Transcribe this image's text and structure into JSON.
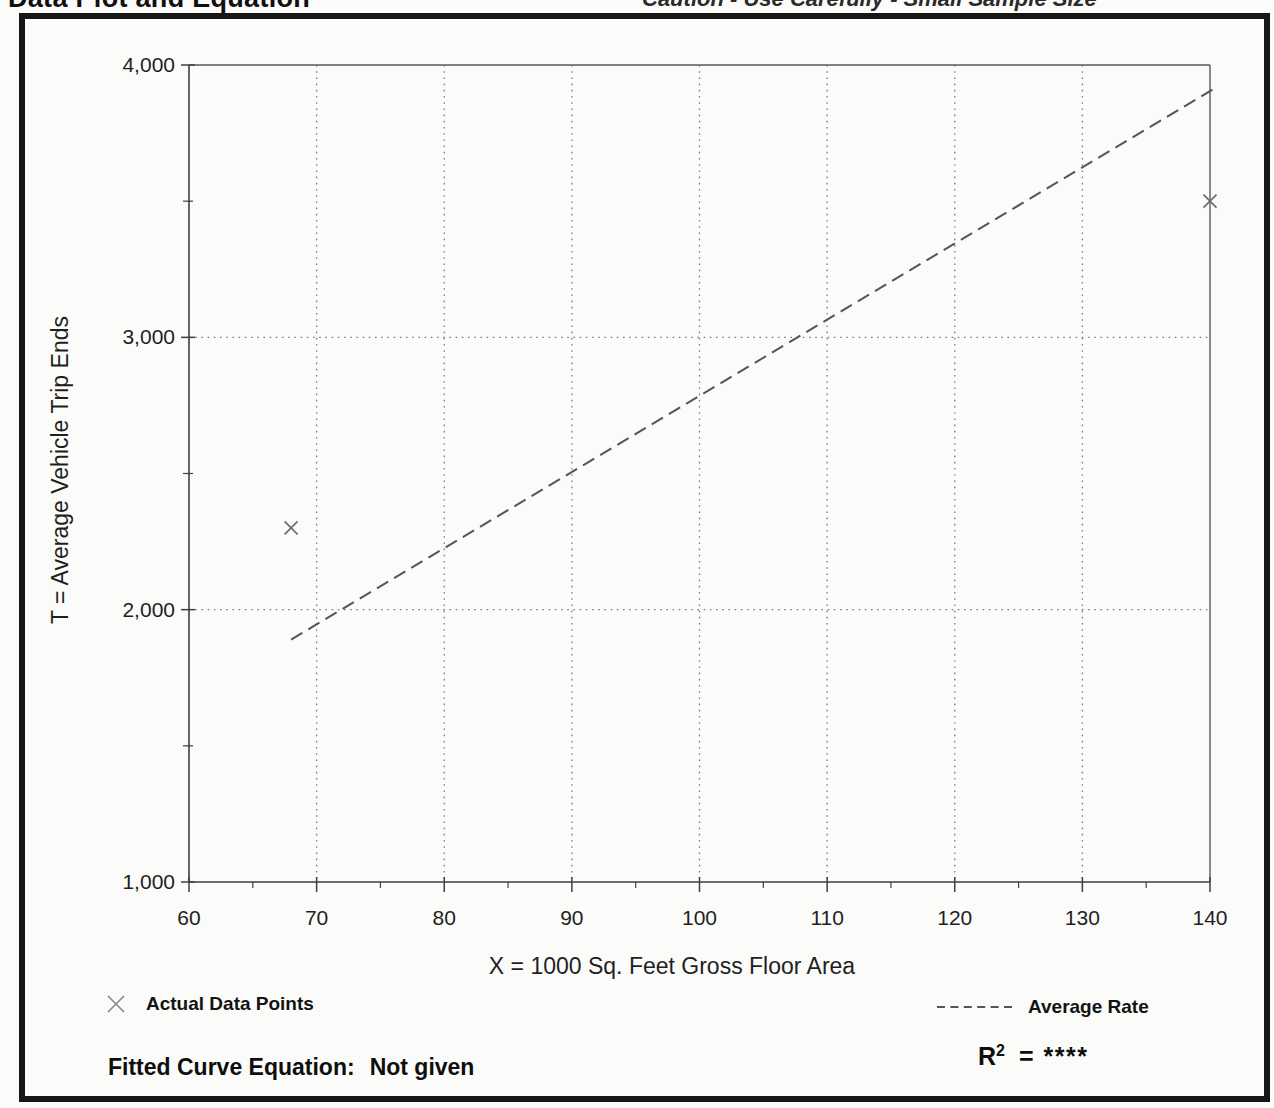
{
  "page": {
    "title": "Data Plot and Equation",
    "caution": "Caution - Use Carefully - Small Sample Size"
  },
  "chart_data": {
    "type": "scatter",
    "title": "Data Plot and Equation",
    "xlabel": "X = 1000 Sq. Feet Gross Floor Area",
    "ylabel": "T = Average Vehicle Trip Ends",
    "xlim": [
      60,
      140
    ],
    "ylim": [
      1000,
      4000
    ],
    "x_major_ticks": [
      60,
      70,
      80,
      90,
      100,
      110,
      120,
      130,
      140
    ],
    "x_minor_ticks": [
      65,
      75,
      85,
      95,
      105,
      115,
      125,
      135
    ],
    "x_tick_labels": [
      "60",
      "70",
      "80",
      "90",
      "100",
      "110",
      "120",
      "130",
      "140"
    ],
    "y_major_ticks": [
      4000,
      3000,
      2000,
      1000
    ],
    "y_minor_ticks": [
      3500,
      2500,
      1500
    ],
    "y_tick_labels": [
      "4,000",
      "3,000",
      "2,000",
      "1,000"
    ],
    "grid": {
      "style": "dotted",
      "vertical_at_x": [
        70,
        80,
        90,
        100,
        110,
        120,
        130
      ],
      "horizontal_at_y": [
        2000,
        3000
      ]
    },
    "legend_position": "bottom",
    "series": [
      {
        "name": "Actual Data Points",
        "kind": "scatter",
        "marker": "x",
        "points": [
          [
            68,
            2300
          ],
          [
            140,
            3500
          ]
        ]
      },
      {
        "name": "Average Rate",
        "kind": "line",
        "style": "dashed",
        "points": [
          [
            68,
            1890
          ],
          [
            140.4,
            3915
          ]
        ]
      }
    ],
    "colors": {
      "text": "#1f1f1f",
      "axis": "#3f3f3f",
      "frame": "#5a5a5a",
      "grid": "#7e7e7e",
      "rate_line": "#555555",
      "marker": "#6e6e6e"
    }
  },
  "legend": {
    "data_points_label": "Actual Data Points",
    "average_rate_label": "Average Rate"
  },
  "footer": {
    "fitted_curve_label": "Fitted Curve Equation:",
    "fitted_curve_value": "Not given",
    "r_squared_base": "R",
    "r_squared_sup": "2",
    "r_squared_value": "= ****"
  }
}
